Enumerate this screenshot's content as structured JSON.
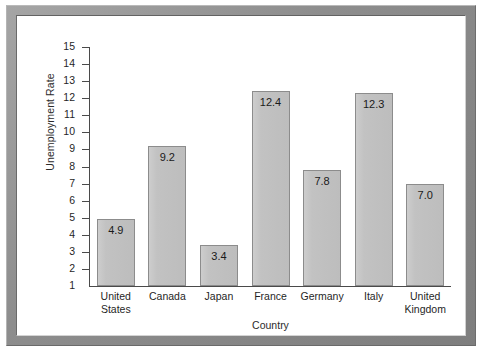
{
  "chart_data": {
    "type": "bar",
    "title": "",
    "xlabel": "Country",
    "ylabel": "Unemployment Rate",
    "categories": [
      "United States",
      "Canada",
      "Japan",
      "France",
      "Germany",
      "Italy",
      "United Kingdom"
    ],
    "category_lines": [
      [
        "United",
        "States"
      ],
      [
        "Canada"
      ],
      [
        "Japan"
      ],
      [
        "France"
      ],
      [
        "Germany"
      ],
      [
        "Italy"
      ],
      [
        "United",
        "Kingdom"
      ]
    ],
    "values": [
      4.9,
      9.2,
      3.4,
      12.4,
      7.8,
      12.3,
      7.0
    ],
    "value_labels": [
      "4.9",
      "9.2",
      "3.4",
      "12.4",
      "7.8",
      "12.3",
      "7.0"
    ],
    "ylim": [
      1,
      15
    ],
    "ytick_labels": [
      "15",
      "14",
      "13",
      "12",
      "11",
      "10",
      "9",
      "8",
      "7",
      "6",
      "5",
      "4",
      "3",
      "2",
      "1"
    ],
    "ytick_values": [
      15,
      14,
      13,
      12,
      11,
      10,
      9,
      8,
      7,
      6,
      5,
      4,
      3,
      2,
      1
    ],
    "grid": false,
    "legend": false,
    "bar_color": "#c2c2c2",
    "bar_border_color": "#8c8c8c",
    "axis_color": "#4a4a4a",
    "text_color": "#1f1f1f",
    "frame_color": "#8f8f8f",
    "background_color": "#ffffff"
  }
}
